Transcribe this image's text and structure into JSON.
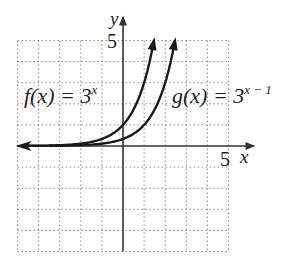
{
  "chart_data": {
    "type": "line",
    "title": "",
    "xlabel": "x",
    "ylabel": "y",
    "xlim": [
      -5,
      5
    ],
    "ylim": [
      -5,
      5
    ],
    "grid": true,
    "grid_style": "dotted",
    "tick_labels": {
      "x": [
        "5"
      ],
      "y": [
        "5"
      ]
    },
    "series": [
      {
        "name": "f(x) = 3^x",
        "label_text": "f(x) = 3",
        "label_exp": "x",
        "formula": "3^x",
        "points": [
          [
            -5,
            0.004
          ],
          [
            -4,
            0.012
          ],
          [
            -3,
            0.037
          ],
          [
            -2,
            0.111
          ],
          [
            -1,
            0.333
          ],
          [
            0,
            1
          ],
          [
            0.5,
            1.732
          ],
          [
            1,
            3
          ],
          [
            1.3,
            4.17
          ],
          [
            1.46,
            4.98
          ]
        ]
      },
      {
        "name": "g(x) = 3^(x-1)",
        "label_text": "g(x) = 3",
        "label_exp": "x − 1",
        "formula": "3^(x-1)",
        "points": [
          [
            -5,
            0.001
          ],
          [
            -4,
            0.004
          ],
          [
            -3,
            0.012
          ],
          [
            -2,
            0.037
          ],
          [
            -1,
            0.111
          ],
          [
            0,
            0.333
          ],
          [
            1,
            1
          ],
          [
            1.5,
            1.732
          ],
          [
            2,
            3
          ],
          [
            2.3,
            4.12
          ],
          [
            2.46,
            4.98
          ]
        ]
      }
    ],
    "colors": {
      "curve": "#1a1a1a",
      "axis": "#333333",
      "grid": "#888888"
    }
  },
  "labels": {
    "y_axis": "y",
    "x_axis": "x",
    "y_tick_5": "5",
    "x_tick_5": "5",
    "f_main": "f(x) = 3",
    "f_exp": "x",
    "g_main": "g(x) = 3",
    "g_exp": "x − 1"
  }
}
